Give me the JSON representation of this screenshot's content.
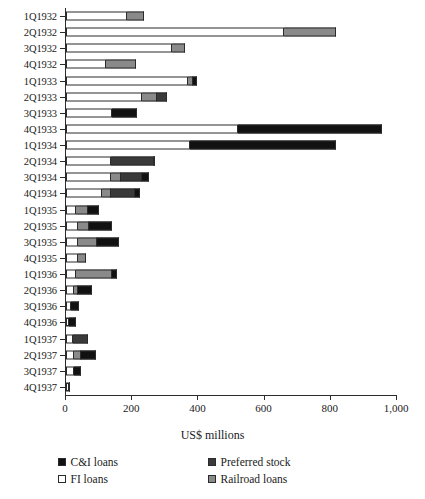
{
  "chart_data": {
    "type": "bar",
    "subtype": "horizontal-stacked",
    "title": "",
    "xlabel": "US$ millions",
    "ylabel": "",
    "xlim": [
      0,
      1000
    ],
    "xticks": [
      0,
      200,
      400,
      600,
      800,
      1000
    ],
    "xtick_labels": [
      "0",
      "200",
      "400",
      "600",
      "800",
      "1,000"
    ],
    "grid": false,
    "legend_position": "bottom",
    "categories": [
      "1Q1932",
      "2Q1932",
      "3Q1932",
      "4Q1932",
      "1Q1933",
      "2Q1933",
      "3Q1933",
      "4Q1933",
      "1Q1934",
      "2Q1934",
      "3Q1934",
      "4Q1934",
      "1Q1935",
      "2Q1935",
      "3Q1935",
      "4Q1935",
      "1Q1936",
      "2Q1936",
      "3Q1936",
      "4Q1936",
      "1Q1937",
      "2Q1937",
      "3Q1937",
      "4Q1937"
    ],
    "series": [
      {
        "name": "FI loans",
        "color": "#ffffff",
        "values": [
          185,
          660,
          320,
          120,
          370,
          230,
          140,
          520,
          375,
          135,
          135,
          110,
          30,
          35,
          35,
          35,
          30,
          25,
          15,
          10,
          20,
          25,
          25,
          8
        ]
      },
      {
        "name": "Railroad loans",
        "color": "#8a8a8a",
        "values": [
          50,
          155,
          40,
          90,
          15,
          45,
          0,
          0,
          0,
          0,
          30,
          25,
          35,
          35,
          60,
          25,
          110,
          10,
          0,
          0,
          0,
          20,
          0,
          0
        ]
      },
      {
        "name": "Preferred stock",
        "color": "#3a3a3a",
        "values": [
          0,
          0,
          0,
          0,
          0,
          30,
          0,
          0,
          0,
          130,
          65,
          75,
          0,
          0,
          0,
          0,
          0,
          0,
          0,
          0,
          45,
          0,
          0,
          0
        ]
      },
      {
        "name": "C&I loans",
        "color": "#111111",
        "values": [
          0,
          0,
          0,
          0,
          10,
          0,
          75,
          435,
          440,
          5,
          20,
          15,
          35,
          70,
          65,
          0,
          15,
          45,
          25,
          20,
          0,
          45,
          20,
          5
        ]
      }
    ],
    "totals": [
      235,
      815,
      360,
      210,
      395,
      305,
      215,
      955,
      815,
      270,
      250,
      225,
      100,
      140,
      160,
      60,
      155,
      80,
      40,
      30,
      65,
      90,
      45,
      13
    ]
  },
  "legend": {
    "items": [
      {
        "label": "C&I loans",
        "color": "#111111",
        "swatch": "legend-swatch-ci-loans"
      },
      {
        "label": "Preferred stock",
        "color": "#3a3a3a",
        "swatch": "legend-swatch-preferred-stock"
      },
      {
        "label": "FI loans",
        "color": "#ffffff",
        "swatch": "legend-swatch-fi-loans"
      },
      {
        "label": "Railroad loans",
        "color": "#8a8a8a",
        "swatch": "legend-swatch-railroad-loans"
      }
    ]
  }
}
